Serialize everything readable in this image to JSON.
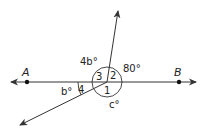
{
  "diagram": {
    "type": "geometry-angles",
    "colors": {
      "stroke": "#333333",
      "text": "#222222",
      "background": "#ffffff"
    },
    "points": [
      {
        "label": "A",
        "x": 27,
        "y": 82
      },
      {
        "label": "B",
        "x": 179,
        "y": 82
      }
    ],
    "angle_numbers": [
      "1",
      "2",
      "3",
      "4"
    ],
    "angle_measures": {
      "four_b": "4b°",
      "eighty": "80°",
      "b": "b°",
      "c": "c°"
    }
  }
}
